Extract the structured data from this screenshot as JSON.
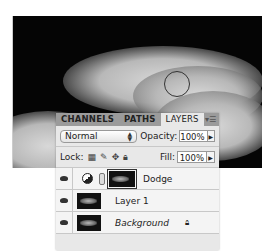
{
  "canvas": {
    "description": "dark sky with white clouds",
    "brush_cursor": "circle"
  },
  "panel": {
    "tabs": [
      {
        "label": "CHANNELS",
        "active": false
      },
      {
        "label": "PATHS",
        "active": false
      },
      {
        "label": "LAYERS",
        "active": true
      }
    ],
    "menu_icon": "panel-menu-icon",
    "blend_mode": "Normal",
    "opacity_label": "Opacity:",
    "opacity_value": "100%",
    "lock_label": "Lock:",
    "fill_label": "Fill:",
    "fill_value": "100%",
    "layers": [
      {
        "name": "Dodge",
        "type": "adjustment",
        "visible": true,
        "selected": true,
        "italic": false
      },
      {
        "name": "Layer 1",
        "type": "pixel",
        "visible": true,
        "italic": false
      },
      {
        "name": "Background",
        "type": "background",
        "visible": true,
        "italic": true,
        "locked": true
      }
    ]
  }
}
